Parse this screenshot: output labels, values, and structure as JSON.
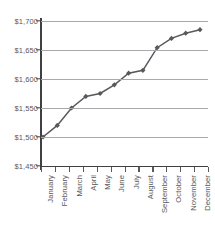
{
  "chart_data": {
    "type": "line",
    "title": "",
    "xlabel": "",
    "ylabel": "",
    "categories": [
      "January",
      "February",
      "March",
      "April",
      "May",
      "June",
      "July",
      "August",
      "September",
      "October",
      "November",
      "December"
    ],
    "values": [
      1500,
      1520,
      1550,
      1570,
      1575,
      1590,
      1610,
      1615,
      1654,
      1670,
      1679,
      1685
    ],
    "ylim": [
      1450,
      1700
    ],
    "ytick_values": [
      1700,
      1650,
      1600,
      1550,
      1500,
      1450
    ],
    "ytick_labels": [
      "$1,700",
      "$1,650",
      "$1,600",
      "$1,550",
      "$1,500",
      "$1,450"
    ],
    "grid": true,
    "legend": "none",
    "marker": "diamond",
    "series_color": "#58595b",
    "gridline_color": "#a7a9ac",
    "axis_color": "#3f4042",
    "background_color": "#ffffff"
  }
}
